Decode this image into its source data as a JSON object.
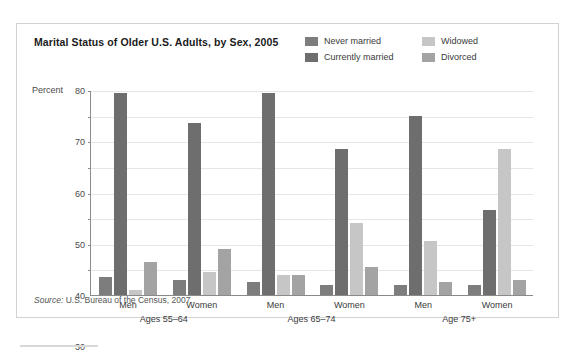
{
  "chart_data": {
    "type": "bar",
    "title": "Marital Status of Older U.S. Adults, by Sex, 2005",
    "xlabel": "",
    "ylabel": "Percent",
    "ylim": [
      0,
      80
    ],
    "yticks": [
      10,
      20,
      30,
      40,
      50,
      60,
      70,
      80
    ],
    "grid": true,
    "legend_position": "top-right",
    "categories": [
      "Men",
      "Women",
      "Men",
      "Women",
      "Men",
      "Women"
    ],
    "groups": [
      {
        "age_label": "Ages 55–64",
        "sexes": [
          {
            "label": "Men",
            "values": [
              7,
              79,
              2,
              13
            ]
          },
          {
            "label": "Women",
            "values": [
              6,
              67,
              9,
              18
            ]
          }
        ]
      },
      {
        "age_label": "Ages 65–74",
        "sexes": [
          {
            "label": "Men",
            "values": [
              5,
              79,
              8,
              8
            ]
          },
          {
            "label": "Women",
            "values": [
              4,
              57,
              28,
              11
            ]
          }
        ]
      },
      {
        "age_label": "Age 75+",
        "sexes": [
          {
            "label": "Men",
            "values": [
              4,
              70,
              21,
              5
            ]
          },
          {
            "label": "Women",
            "values": [
              4,
              33,
              57,
              6
            ]
          }
        ]
      }
    ],
    "series": [
      {
        "name": "Never married",
        "color": "#7d7d7d",
        "values": [
          7,
          6,
          5,
          4,
          4,
          4
        ]
      },
      {
        "name": "Currently married",
        "color": "#6e6e6e",
        "values": [
          79,
          67,
          79,
          57,
          70,
          33
        ]
      },
      {
        "name": "Widowed",
        "color": "#c6c6c6",
        "values": [
          2,
          9,
          8,
          28,
          21,
          57
        ]
      },
      {
        "name": "Divorced",
        "color": "#a3a3a3",
        "values": [
          13,
          18,
          8,
          11,
          5,
          6
        ]
      }
    ],
    "source": "Source: U.S. Bureau of the Census, 2007.",
    "source_prefix": "Source:",
    "source_text": " U.S. Bureau of the Census, 2007."
  },
  "legend": {
    "items": [
      {
        "label": "Never married",
        "color": "#7d7d7d"
      },
      {
        "label": "Widowed",
        "color": "#c6c6c6"
      },
      {
        "label": "Currently married",
        "color": "#6e6e6e"
      },
      {
        "label": "Divorced",
        "color": "#a3a3a3"
      }
    ]
  }
}
